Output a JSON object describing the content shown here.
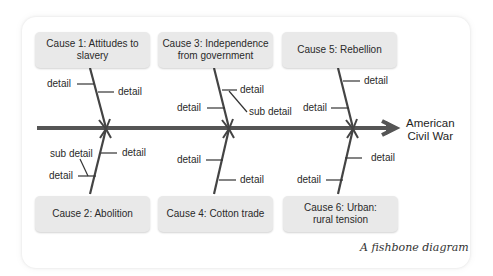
{
  "diagram": {
    "type": "fishbone",
    "effect": {
      "line1": "American",
      "line2": "Civil War"
    },
    "caption": "A fishbone diagram",
    "colors": {
      "spine": "#555555",
      "box_fill": "#e9e9e9",
      "text": "#2a2a2a"
    },
    "causes": [
      {
        "id": 1,
        "line1": "Cause 1: Attitudes to",
        "line2": "slavery",
        "position": "top",
        "details": [
          {
            "text": "detail",
            "side": "left"
          },
          {
            "text": "detail",
            "side": "right"
          }
        ]
      },
      {
        "id": 3,
        "line1": "Cause 3: Independence",
        "line2": "from government",
        "position": "top",
        "details": [
          {
            "text": "detail",
            "side": "right",
            "sub_detail": "sub detail"
          },
          {
            "text": "detail",
            "side": "left"
          }
        ]
      },
      {
        "id": 5,
        "line1": "Cause 5: Rebellion",
        "line2": "",
        "position": "top",
        "details": [
          {
            "text": "detail",
            "side": "right"
          },
          {
            "text": "detail",
            "side": "left"
          }
        ]
      },
      {
        "id": 2,
        "line1": "Cause 2: Abolition",
        "line2": "",
        "position": "bottom",
        "details": [
          {
            "text": "detail",
            "side": "right"
          },
          {
            "text": "detail",
            "side": "left",
            "sub_detail": "sub detail"
          }
        ]
      },
      {
        "id": 4,
        "line1": "Cause 4: Cotton trade",
        "line2": "",
        "position": "bottom",
        "details": [
          {
            "text": "detail",
            "side": "left"
          },
          {
            "text": "detail",
            "side": "right"
          }
        ]
      },
      {
        "id": 6,
        "line1": "Cause 6: Urban:",
        "line2": "rural tension",
        "position": "bottom",
        "details": [
          {
            "text": "detail",
            "side": "right"
          },
          {
            "text": "detail",
            "side": "left"
          }
        ]
      }
    ],
    "labels": {
      "detail": "detail",
      "sub_detail": "sub detail"
    }
  }
}
